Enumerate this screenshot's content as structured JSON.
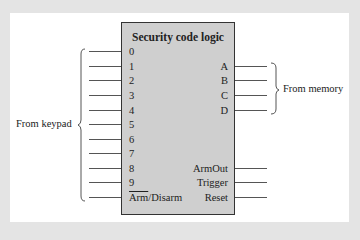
{
  "diagram": {
    "title": "Security code logic",
    "inputs_left": [
      "0",
      "1",
      "2",
      "3",
      "4",
      "5",
      "6",
      "7",
      "8",
      "9"
    ],
    "arm_disarm": {
      "arm": "Arm",
      "slash_disarm": "/Disarm"
    },
    "inputs_right": [
      "A",
      "B",
      "C",
      "D"
    ],
    "outputs_right": [
      "ArmOut",
      "Trigger",
      "Reset"
    ],
    "group_left_label": "From keypad",
    "group_right_label": "From memory"
  },
  "colors": {
    "background": "#e4e4e4",
    "panel": "#ffffff",
    "box": "#cfcfcf",
    "line": "#555555"
  }
}
